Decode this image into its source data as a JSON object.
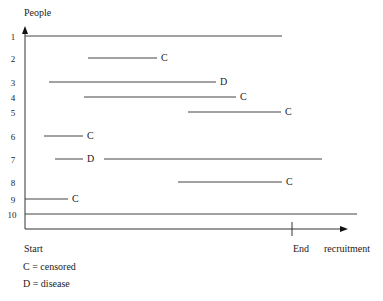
{
  "diagram": {
    "y_axis_label": "People",
    "x_axis_start_label": "Start",
    "x_axis_end_label": "End",
    "x_axis_recruitment_label": "recruitment",
    "legend": [
      {
        "text": "C = censored"
      },
      {
        "text": "D = disease"
      }
    ],
    "rows": [
      {
        "num": "1",
        "y": 36,
        "segments": [
          [
            25,
            282
          ]
        ],
        "mark": "",
        "mark_x": 0
      },
      {
        "num": "2",
        "y": 58,
        "segments": [
          [
            88,
            157
          ]
        ],
        "mark": "C",
        "mark_x": 161
      },
      {
        "num": "3",
        "y": 82,
        "segments": [
          [
            49,
            216
          ]
        ],
        "mark": "D",
        "mark_x": 220
      },
      {
        "num": "4",
        "y": 97,
        "segments": [
          [
            84,
            236
          ]
        ],
        "mark": "C",
        "mark_x": 240
      },
      {
        "num": "5",
        "y": 112,
        "segments": [
          [
            188,
            281
          ]
        ],
        "mark": "C",
        "mark_x": 285
      },
      {
        "num": "6",
        "y": 136,
        "segments": [
          [
            44,
            83
          ]
        ],
        "mark": "C",
        "mark_x": 87
      },
      {
        "num": "7",
        "y": 159,
        "segments": [
          [
            55,
            83
          ],
          [
            104,
            322
          ]
        ],
        "mark": "D",
        "mark_x": 87
      },
      {
        "num": "8",
        "y": 182,
        "segments": [
          [
            178,
            282
          ]
        ],
        "mark": "C",
        "mark_x": 286
      },
      {
        "num": "9",
        "y": 199,
        "segments": [
          [
            25,
            68
          ]
        ],
        "mark": "C",
        "mark_x": 72
      },
      {
        "num": "10",
        "y": 214,
        "segments": [
          [
            25,
            357
          ]
        ],
        "mark": "",
        "mark_x": 0
      }
    ]
  }
}
